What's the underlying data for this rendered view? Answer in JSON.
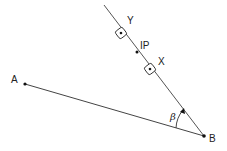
{
  "diagram": {
    "points": {
      "A": {
        "label": "A",
        "x": 25,
        "y": 84
      },
      "B": {
        "label": "B",
        "x": 204,
        "y": 136
      },
      "IP": {
        "label": "IP",
        "x": 137,
        "y": 52
      },
      "X": {
        "label": "X",
        "x": 150,
        "y": 69
      },
      "Y": {
        "label": "Y",
        "x": 121,
        "y": 33
      }
    },
    "angle_label": "β",
    "colors": {
      "line": "#444444",
      "text": "#222222"
    }
  }
}
